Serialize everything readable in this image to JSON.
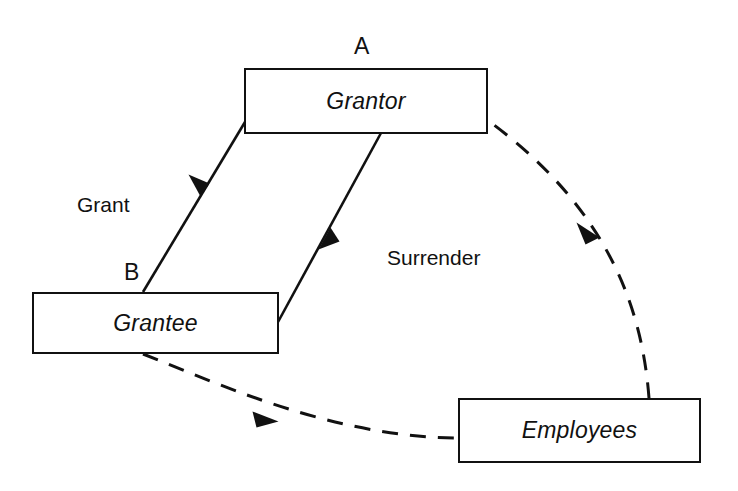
{
  "diagram": {
    "background_color": "#ffffff",
    "stroke_color": "#111111",
    "nodes": [
      {
        "id": "grantor",
        "label": "Grantor",
        "point_label": "A"
      },
      {
        "id": "grantee",
        "label": "Grantee",
        "point_label": "B"
      },
      {
        "id": "employees",
        "label": "Employees",
        "point_label": ""
      }
    ],
    "edges": [
      {
        "id": "grant",
        "label": "Grant",
        "from": "grantor",
        "to": "grantee",
        "style": "solid",
        "arrow": "single"
      },
      {
        "id": "surrender",
        "label": "Surrender",
        "from": "grantee",
        "to": "grantor",
        "style": "solid",
        "arrow": "single"
      },
      {
        "id": "employees-to-grantor",
        "label": "",
        "from": "employees",
        "to": "grantor",
        "style": "dashed",
        "arrow": "single"
      },
      {
        "id": "grantee-to-employees",
        "label": "",
        "from": "grantee",
        "to": "employees",
        "style": "dashed",
        "arrow": "single"
      }
    ],
    "point_labels": [
      {
        "id": "a",
        "text": "A"
      },
      {
        "id": "b",
        "text": "B"
      }
    ]
  }
}
